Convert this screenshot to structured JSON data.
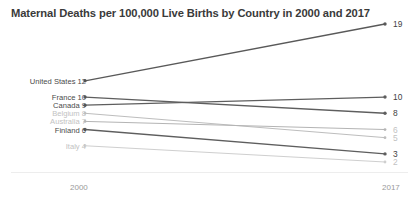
{
  "chart_data": {
    "type": "line",
    "title": "Maternal Deaths per 100,000 Live Births by Country in 2000 and 2017",
    "xlabel": "",
    "ylabel": "",
    "categories": [
      "2000",
      "2017"
    ],
    "x_tick_labels": [
      "2000",
      "2017"
    ],
    "grid": false,
    "legend": "none",
    "ylim": [
      0,
      20
    ],
    "series": [
      {
        "name": "United States",
        "values": [
          12,
          19
        ],
        "left_label": "United States 12",
        "right_label": "19",
        "color": "#595959",
        "emphasis": "dark"
      },
      {
        "name": "France",
        "values": [
          10,
          8
        ],
        "left_label": "France 10",
        "right_label": "8",
        "color": "#5e5e5e",
        "emphasis": "dark"
      },
      {
        "name": "Canada",
        "values": [
          9,
          10
        ],
        "left_label": "Canada 9",
        "right_label": "10",
        "color": "#5e5e5e",
        "emphasis": "dark"
      },
      {
        "name": "Belgium",
        "values": [
          8,
          5
        ],
        "left_label": "Belgium 8",
        "right_label": "5",
        "color": "#bdbdbd",
        "emphasis": "light"
      },
      {
        "name": "Australia",
        "values": [
          7,
          6
        ],
        "left_label": "Australia 7",
        "right_label": "6",
        "color": "#b4b4b4",
        "emphasis": "light"
      },
      {
        "name": "Finland",
        "values": [
          6,
          3
        ],
        "left_label": "Finland 6",
        "right_label": "3",
        "color": "#5e5e5e",
        "emphasis": "dark"
      },
      {
        "name": "Italy",
        "values": [
          4,
          2
        ],
        "left_label": "Italy 4",
        "right_label": "2",
        "color": "#cfcfcf",
        "emphasis": "light"
      }
    ]
  },
  "axis": {
    "left_tick": "2000",
    "right_tick": "2017"
  },
  "colors": {
    "title": "#3a3a3a",
    "dark_line": "#5e5e5e",
    "light_line": "#bdbdbd",
    "dark_label": "#4a4a4a",
    "light_label": "#c2c2c2",
    "baseline": "#ededed"
  }
}
